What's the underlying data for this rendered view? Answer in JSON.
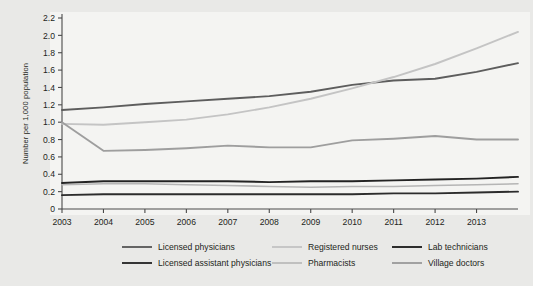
{
  "chart_data": {
    "type": "line",
    "title": "",
    "xlabel": "",
    "ylabel": "Number per 1,000 population",
    "xlim": [
      2003,
      2014
    ],
    "ylim": [
      0,
      2.2
    ],
    "grid": false,
    "legend_position": "bottom",
    "x": [
      2003,
      2004,
      2005,
      2006,
      2007,
      2008,
      2009,
      2010,
      2011,
      2012,
      2013,
      2014
    ],
    "xtick_labels": [
      "2003",
      "2004",
      "2005",
      "2006",
      "2007",
      "2008",
      "2009",
      "2010",
      "2011",
      "2012",
      "2013"
    ],
    "xticks": [
      2003,
      2004,
      2005,
      2006,
      2007,
      2008,
      2009,
      2010,
      2011,
      2012,
      2013
    ],
    "ytick_labels": [
      "0",
      "0.2",
      "0.4",
      "0.6",
      "0.8",
      "1.0",
      "1.2",
      "1.4",
      "1.6",
      "1.8",
      "2.0",
      "2.2"
    ],
    "yticks": [
      0,
      0.2,
      0.4,
      0.6,
      0.8,
      1.0,
      1.2,
      1.4,
      1.6,
      1.8,
      2.0,
      2.2
    ],
    "series": [
      {
        "name": "Licensed physicians",
        "color": "#5d5d5d",
        "width": 1.9,
        "values": [
          1.14,
          1.17,
          1.21,
          1.24,
          1.27,
          1.3,
          1.35,
          1.43,
          1.48,
          1.5,
          1.58,
          1.68
        ]
      },
      {
        "name": "Registered nurses",
        "color": "#c4c4c4",
        "width": 1.9,
        "values": [
          0.98,
          0.97,
          1.0,
          1.03,
          1.09,
          1.17,
          1.27,
          1.39,
          1.52,
          1.67,
          1.85,
          2.04
        ]
      },
      {
        "name": "Lab technicians",
        "color": "#232323",
        "width": 1.9,
        "values": [
          0.3,
          0.32,
          0.32,
          0.32,
          0.32,
          0.31,
          0.32,
          0.32,
          0.33,
          0.34,
          0.35,
          0.37
        ]
      },
      {
        "name": "Licensed assistant physicians",
        "color": "#2c2c2c",
        "width": 1.9,
        "values": [
          0.16,
          0.17,
          0.17,
          0.17,
          0.17,
          0.17,
          0.17,
          0.17,
          0.18,
          0.18,
          0.19,
          0.2
        ]
      },
      {
        "name": "Pharmacists",
        "color": "#b5b5b5",
        "width": 1.6,
        "values": [
          0.28,
          0.29,
          0.29,
          0.28,
          0.27,
          0.26,
          0.25,
          0.26,
          0.26,
          0.27,
          0.28,
          0.29
        ]
      },
      {
        "name": "Village doctors",
        "color": "#9e9e9e",
        "width": 1.9,
        "values": [
          1.0,
          0.67,
          0.68,
          0.7,
          0.73,
          0.71,
          0.71,
          0.79,
          0.81,
          0.84,
          0.8,
          0.8
        ]
      }
    ]
  },
  "legend": {
    "entries": [
      {
        "label": "Licensed physicians",
        "color": "#5d5d5d"
      },
      {
        "label": "Registered nurses",
        "color": "#c4c4c4"
      },
      {
        "label": "Lab technicians",
        "color": "#232323"
      },
      {
        "label": "Licensed assistant physicians",
        "color": "#2c2c2c"
      },
      {
        "label": "Pharmacists",
        "color": "#b5b5b5"
      },
      {
        "label": "Village doctors",
        "color": "#9e9e9e"
      }
    ]
  },
  "colors": {
    "background": "#e9e9e7",
    "plot_background": "#f4f4f2",
    "axis": "#4a4a4a",
    "text": "#231f20"
  }
}
